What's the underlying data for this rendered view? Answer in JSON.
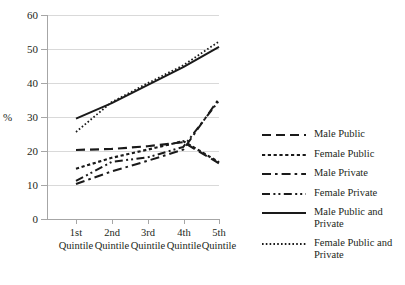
{
  "chart_data": {
    "type": "line",
    "title": "",
    "xlabel": "",
    "ylabel": "%",
    "ylim": [
      0,
      60
    ],
    "ytick_values": [
      0,
      10,
      20,
      30,
      40,
      50,
      60
    ],
    "grid": true,
    "legend_position": "right",
    "categories": [
      "1st Quintile",
      "2nd Quintile",
      "3rd Quintile",
      "4th Quintile",
      "5th Quintile"
    ],
    "series": [
      {
        "name": "Male Public",
        "style": "dashed",
        "values": [
          20.3,
          20.6,
          21.4,
          22.6,
          16.4
        ]
      },
      {
        "name": "Female Public",
        "style": "dotted",
        "values": [
          14.8,
          18.0,
          20.4,
          22.9,
          16.7
        ]
      },
      {
        "name": "Male Private",
        "style": "dash-dot",
        "values": [
          10.3,
          14.0,
          17.1,
          20.4,
          35.4
        ]
      },
      {
        "name": "Female Private",
        "style": "dash-dot-dot",
        "values": [
          11.2,
          16.8,
          18.1,
          21.2,
          34.8
        ]
      },
      {
        "name": "Male Public and Private",
        "style": "solid",
        "values": [
          29.5,
          34.1,
          39.4,
          44.7,
          50.6
        ]
      },
      {
        "name": "Female Public and Private",
        "style": "fine-dotted",
        "values": [
          25.6,
          34.4,
          39.9,
          45.2,
          52.2
        ]
      }
    ]
  },
  "axis": {
    "y_label": "%",
    "y_ticks": [
      "0",
      "10",
      "20",
      "30",
      "40",
      "50",
      "60"
    ],
    "x_ticks": [
      {
        "line1": "1st",
        "line2": "Quintile"
      },
      {
        "line1": "2nd",
        "line2": "Quintile"
      },
      {
        "line1": "3rd",
        "line2": "Quintile"
      },
      {
        "line1": "4th",
        "line2": "Quintile"
      },
      {
        "line1": "5th",
        "line2": "Quintile"
      }
    ]
  },
  "legend": {
    "items": [
      {
        "label": "Male Public",
        "style": "dashed"
      },
      {
        "label": "Female Public",
        "style": "dotted"
      },
      {
        "label": "Male Private",
        "style": "dash-dot"
      },
      {
        "label": "Female Private",
        "style": "dash-dot-dot"
      },
      {
        "label": "Male Public and\nPrivate",
        "style": "solid"
      },
      {
        "label": "Female Public and\nPrivate",
        "style": "fine-dotted"
      }
    ]
  },
  "colors": {
    "line": "#1a1a1a",
    "grid": "#d9d9d9",
    "axis": "#a6a6a6",
    "text": "#231f20",
    "background": "#ffffff"
  }
}
